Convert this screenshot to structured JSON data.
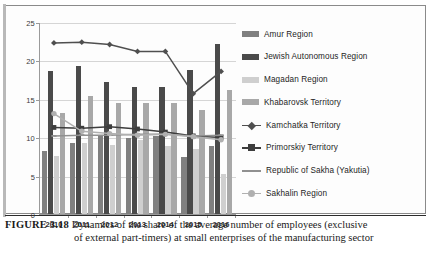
{
  "figure": {
    "number_label": "FIGURE 3.18",
    "caption_line1": "Dynamics of the share of the average number of employees (exclusive",
    "caption_line2": "of external part-timers) at small enterprises of the manufacturing sector"
  },
  "chart_data": {
    "type": "bar",
    "title": "",
    "xlabel": "",
    "ylabel": "",
    "categories": [
      "2010",
      "2011",
      "2012",
      "2013",
      "2014",
      "2015",
      "2016"
    ],
    "ylim": [
      0,
      25
    ],
    "yticks": [
      "0",
      "5",
      "10",
      "15",
      "20",
      "25"
    ],
    "ytick_values": [
      0,
      5,
      10,
      15,
      20,
      25
    ],
    "grid": true,
    "legend_position": "right",
    "series": [
      {
        "name": "Amur Region",
        "kind": "bar",
        "color": "#808080",
        "values": [
          8.2,
          9.3,
          10.2,
          9.9,
          10.1,
          7.4,
          8.8
        ]
      },
      {
        "name": "Jewish Autonomous Region",
        "kind": "bar",
        "color": "#4a4a4a",
        "values": [
          18.6,
          19.3,
          17.2,
          16.6,
          16.5,
          18.8,
          22.2
        ]
      },
      {
        "name": "Magadan Region",
        "kind": "bar",
        "color": "#cfcfcf",
        "values": [
          7.6,
          9.2,
          9.0,
          9.6,
          8.8,
          8.5,
          5.2
        ]
      },
      {
        "name": "Khabarovsk Territory",
        "kind": "bar",
        "color": "#a8a8a8",
        "values": [
          13.1,
          15.4,
          14.5,
          14.4,
          14.4,
          13.5,
          16.2
        ]
      },
      {
        "name": "Kamchatka Territory",
        "kind": "line",
        "color": "#4f4f4f",
        "marker": "diamond",
        "values": [
          22.4,
          22.5,
          22.2,
          21.3,
          21.3,
          15.8,
          18.7
        ]
      },
      {
        "name": "Primorskiy Territory",
        "kind": "line",
        "color": "#3d3d3d",
        "marker": "square",
        "values": [
          11.4,
          11.3,
          11.5,
          11.2,
          10.8,
          10.3,
          10.1
        ]
      },
      {
        "name": "Republic of Sakha (Yakutia)",
        "kind": "line",
        "color": "#909090",
        "marker": "dash",
        "values": [
          10.3,
          10.4,
          10.4,
          10.5,
          10.5,
          10.3,
          10.4
        ]
      },
      {
        "name": "Sakhalin Region",
        "kind": "line",
        "color": "#b0b0b0",
        "marker": "circle",
        "values": [
          13.2,
          10.9,
          10.6,
          10.4,
          10.5,
          10.2,
          9.8
        ]
      }
    ]
  },
  "colors": {
    "grid": "#d5d5d5",
    "axis": "#9a9a9a",
    "text": "#1e1e1e",
    "frame": "#8a8a8a"
  }
}
